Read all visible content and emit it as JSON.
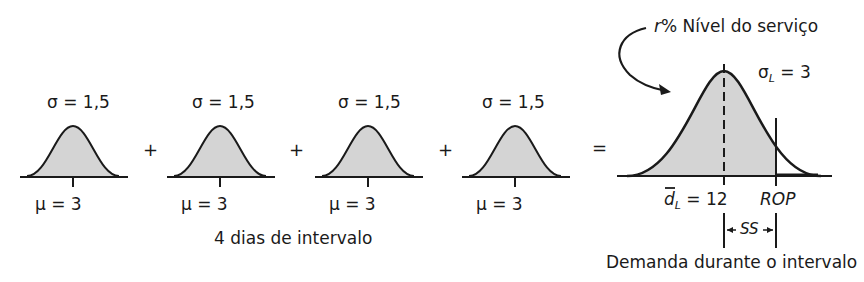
{
  "diagram": {
    "fill_color": "#d4d4d4",
    "line_color": "#1a1a1a",
    "daily_curves": [
      {
        "sigma_label": "σ = 1,5",
        "mu_label": "μ = 3"
      },
      {
        "sigma_label": "σ = 1,5",
        "mu_label": "μ = 3"
      },
      {
        "sigma_label": "σ = 1,5",
        "mu_label": "μ = 3"
      },
      {
        "sigma_label": "σ = 1,5",
        "mu_label": "μ = 3"
      }
    ],
    "operators": [
      "+",
      "+",
      "+",
      "="
    ],
    "interval_label": "4 dias de intervalo",
    "result": {
      "service_level_prefix": "r",
      "service_level_text": "% Nível do serviço",
      "sigma_prefix": "σ",
      "sigma_sub": "L",
      "sigma_value": " = 3",
      "mean_symbol": "d",
      "mean_sub": "L",
      "mean_value": " = 12",
      "rop_label": "ROP",
      "ss_label": "SS",
      "axis_label": "Demanda durante o intervalo"
    }
  }
}
